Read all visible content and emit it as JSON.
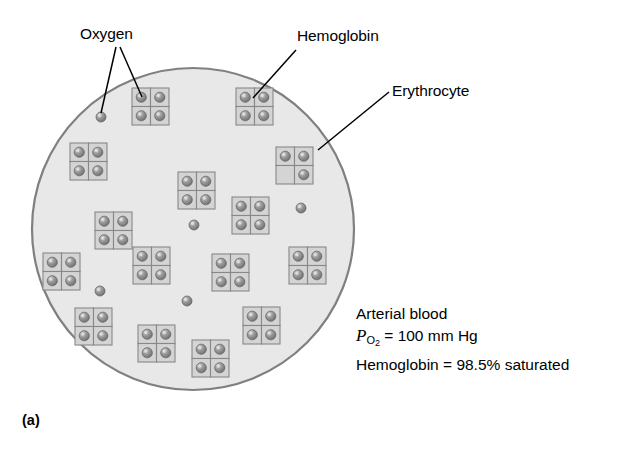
{
  "figure": {
    "panel_label": "(a)",
    "background_color": "#ffffff"
  },
  "labels": {
    "oxygen": "Oxygen",
    "hemoglobin": "Hemoglobin",
    "erythrocyte": "Erythrocyte"
  },
  "stats": {
    "line1": "Arterial blood",
    "po2_symbol": "P",
    "po2_subscript": "O",
    "po2_subscript_number": "2",
    "po2_value": " = 100 mm Hg",
    "line3": "Hemoglobin = 98.5% saturated"
  },
  "colors": {
    "cell_fill": "#e8e8e8",
    "cell_stroke": "#808080",
    "subunit_fill": "#d4d4d4",
    "subunit_stroke": "#888888",
    "oxygen_fill": "#8a8a8a",
    "oxygen_highlight": "#d8d8d8",
    "leader_line": "#000000",
    "text": "#000000"
  },
  "cell": {
    "center_x": 193,
    "center_y": 229,
    "radius": 161
  },
  "free_oxygen": [
    {
      "x": 101,
      "y": 117
    },
    {
      "x": 301,
      "y": 208
    },
    {
      "x": 194,
      "y": 225
    },
    {
      "x": 100,
      "y": 291
    },
    {
      "x": 187,
      "y": 301
    }
  ],
  "hemoglobin_molecules": [
    {
      "x": 132,
      "y": 88,
      "subunits": [
        1,
        1,
        1,
        1
      ]
    },
    {
      "x": 236,
      "y": 88,
      "subunits": [
        1,
        1,
        1,
        1
      ]
    },
    {
      "x": 70,
      "y": 143,
      "subunits": [
        1,
        1,
        1,
        1
      ]
    },
    {
      "x": 178,
      "y": 172,
      "subunits": [
        1,
        1,
        1,
        1
      ]
    },
    {
      "x": 276,
      "y": 147,
      "subunits": [
        1,
        1,
        0,
        1
      ]
    },
    {
      "x": 95,
      "y": 212,
      "subunits": [
        1,
        1,
        1,
        1
      ]
    },
    {
      "x": 232,
      "y": 197,
      "subunits": [
        1,
        1,
        1,
        1
      ]
    },
    {
      "x": 43,
      "y": 253,
      "subunits": [
        1,
        1,
        1,
        1
      ]
    },
    {
      "x": 133,
      "y": 247,
      "subunits": [
        1,
        1,
        1,
        1
      ]
    },
    {
      "x": 212,
      "y": 254,
      "subunits": [
        1,
        1,
        1,
        1
      ]
    },
    {
      "x": 289,
      "y": 247,
      "subunits": [
        1,
        1,
        1,
        1
      ]
    },
    {
      "x": 75,
      "y": 308,
      "subunits": [
        1,
        1,
        1,
        1
      ]
    },
    {
      "x": 138,
      "y": 325,
      "subunits": [
        1,
        1,
        1,
        1
      ]
    },
    {
      "x": 192,
      "y": 340,
      "subunits": [
        1,
        1,
        1,
        1
      ]
    },
    {
      "x": 243,
      "y": 307,
      "subunits": [
        1,
        1,
        1,
        1
      ]
    }
  ],
  "leader_lines": {
    "oxygen": [
      {
        "from_x": 116,
        "from_y": 47,
        "to_x": 101,
        "to_y": 113
      },
      {
        "from_x": 120,
        "from_y": 47,
        "to_x": 142,
        "to_y": 97
      }
    ],
    "hemoglobin": [
      {
        "from_x": 296,
        "from_y": 50,
        "to_x": 253,
        "to_y": 98
      }
    ],
    "erythrocyte": [
      {
        "from_x": 389,
        "from_y": 92,
        "to_x": 318,
        "to_y": 150
      }
    ]
  }
}
